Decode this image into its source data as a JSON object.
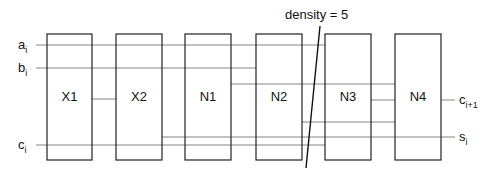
{
  "annotation": {
    "text": "density = 5"
  },
  "inputs": [
    {
      "base": "a",
      "sub": "i"
    },
    {
      "base": "b",
      "sub": "i"
    },
    {
      "base": "c",
      "sub": "i"
    }
  ],
  "outputs": [
    {
      "base": "c",
      "sub": "i+1"
    },
    {
      "base": "s",
      "sub": "i"
    }
  ],
  "blocks": [
    {
      "label": "X1"
    },
    {
      "label": "X2"
    },
    {
      "label": "N1"
    },
    {
      "label": "N2"
    },
    {
      "label": "N3"
    },
    {
      "label": "N4"
    }
  ]
}
